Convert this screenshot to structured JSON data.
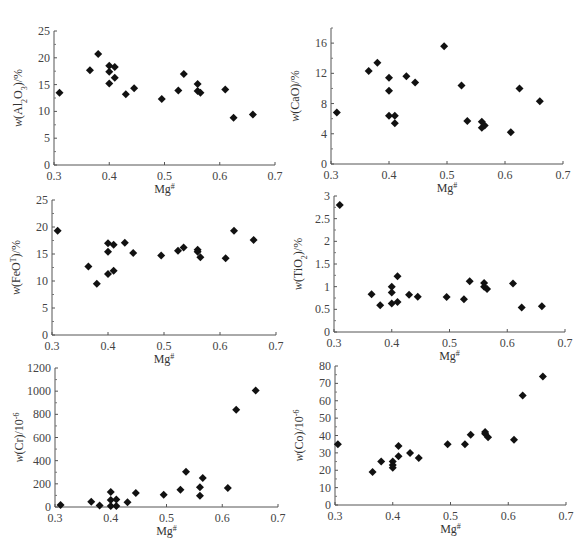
{
  "figure": {
    "caption": ""
  },
  "chart_data": [
    {
      "type": "scatter",
      "id": "al2o3",
      "title": "",
      "xlabel": "Mg#",
      "ylabel": "w(Al2O3)/%",
      "xlim": [
        0.3,
        0.7
      ],
      "ylim": [
        0,
        25
      ],
      "xticks": [
        0.3,
        0.4,
        0.5,
        0.6,
        0.7
      ],
      "yticks": [
        0,
        5,
        10,
        15,
        20,
        25
      ],
      "grid": false,
      "marker": "diamond",
      "x": [
        0.31,
        0.365,
        0.38,
        0.4,
        0.4,
        0.4,
        0.41,
        0.41,
        0.43,
        0.445,
        0.495,
        0.525,
        0.535,
        0.56,
        0.56,
        0.565,
        0.61,
        0.625,
        0.66
      ],
      "y": [
        13.5,
        17.7,
        20.7,
        18.5,
        17.4,
        15.2,
        18.3,
        16.3,
        13.2,
        14.3,
        12.3,
        13.9,
        17.0,
        15.1,
        13.8,
        13.5,
        14.1,
        8.8,
        9.4
      ]
    },
    {
      "type": "scatter",
      "id": "cao",
      "title": "",
      "xlabel": "Mg#",
      "ylabel": "w(CaO)/%",
      "xlim": [
        0.3,
        0.7
      ],
      "ylim": [
        0,
        18
      ],
      "xticks": [
        0.3,
        0.4,
        0.5,
        0.6,
        0.7
      ],
      "yticks": [
        0,
        4,
        8,
        12,
        16
      ],
      "grid": false,
      "marker": "diamond",
      "x": [
        0.31,
        0.365,
        0.38,
        0.4,
        0.4,
        0.4,
        0.41,
        0.41,
        0.43,
        0.445,
        0.495,
        0.525,
        0.535,
        0.56,
        0.56,
        0.565,
        0.61,
        0.625,
        0.66
      ],
      "y": [
        6.8,
        12.3,
        13.4,
        11.4,
        9.7,
        6.4,
        6.4,
        5.4,
        11.6,
        10.8,
        15.6,
        10.4,
        5.7,
        5.6,
        4.8,
        5.1,
        4.2,
        10.0,
        8.3
      ]
    },
    {
      "type": "scatter",
      "id": "feot",
      "title": "",
      "xlabel": "Mg#",
      "ylabel": "w(FeOT)/%",
      "xlim": [
        0.3,
        0.7
      ],
      "ylim": [
        0,
        25
      ],
      "xticks": [
        0.3,
        0.4,
        0.5,
        0.6,
        0.7
      ],
      "yticks": [
        0,
        5,
        10,
        15,
        20,
        25
      ],
      "grid": false,
      "marker": "diamond",
      "x": [
        0.31,
        0.365,
        0.38,
        0.4,
        0.4,
        0.4,
        0.41,
        0.41,
        0.43,
        0.445,
        0.495,
        0.525,
        0.535,
        0.56,
        0.56,
        0.565,
        0.61,
        0.625,
        0.66
      ],
      "y": [
        19.3,
        12.7,
        9.5,
        17.0,
        15.4,
        11.3,
        16.7,
        11.9,
        17.1,
        15.2,
        14.7,
        15.6,
        16.2,
        15.8,
        15.4,
        14.4,
        14.2,
        19.3,
        17.6
      ]
    },
    {
      "type": "scatter",
      "id": "tio2",
      "title": "",
      "xlabel": "Mg#",
      "ylabel": "w(TiO2)/%",
      "xlim": [
        0.3,
        0.7
      ],
      "ylim": [
        0,
        3
      ],
      "xticks": [
        0.3,
        0.4,
        0.5,
        0.6,
        0.7
      ],
      "yticks": [
        0,
        0.5,
        1,
        1.5,
        2,
        2.5,
        3
      ],
      "grid": false,
      "marker": "diamond",
      "x": [
        0.31,
        0.365,
        0.38,
        0.4,
        0.4,
        0.4,
        0.41,
        0.41,
        0.43,
        0.445,
        0.495,
        0.525,
        0.535,
        0.56,
        0.56,
        0.565,
        0.61,
        0.625,
        0.66
      ],
      "y": [
        2.8,
        0.83,
        0.59,
        1.0,
        0.87,
        0.63,
        1.23,
        0.66,
        0.82,
        0.78,
        0.77,
        0.72,
        1.12,
        1.08,
        1.0,
        0.95,
        1.07,
        0.54,
        0.57
      ]
    },
    {
      "type": "scatter",
      "id": "cr",
      "title": "",
      "xlabel": "Mg#",
      "ylabel": "w(Cr)/10^-6",
      "xlim": [
        0.3,
        0.7
      ],
      "ylim": [
        0,
        1200
      ],
      "xticks": [
        0.3,
        0.4,
        0.5,
        0.6,
        0.7
      ],
      "yticks": [
        0,
        200,
        400,
        600,
        800,
        1000,
        1200
      ],
      "grid": false,
      "marker": "diamond",
      "x": [
        0.31,
        0.365,
        0.38,
        0.4,
        0.4,
        0.4,
        0.41,
        0.41,
        0.43,
        0.445,
        0.495,
        0.525,
        0.535,
        0.56,
        0.56,
        0.565,
        0.61,
        0.625,
        0.66
      ],
      "y": [
        18,
        45,
        12,
        130,
        60,
        8,
        65,
        8,
        42,
        120,
        105,
        150,
        305,
        170,
        98,
        250,
        165,
        840,
        1005
      ]
    },
    {
      "type": "scatter",
      "id": "co",
      "title": "",
      "xlabel": "Mg#",
      "ylabel": "w(Co)/10^-6",
      "xlim": [
        0.3,
        0.7
      ],
      "ylim": [
        0,
        80
      ],
      "xticks": [
        0.3,
        0.4,
        0.5,
        0.6,
        0.7
      ],
      "yticks": [
        0,
        10,
        20,
        30,
        40,
        50,
        60,
        70,
        80
      ],
      "grid": false,
      "marker": "diamond",
      "x": [
        0.305,
        0.365,
        0.38,
        0.4,
        0.4,
        0.4,
        0.41,
        0.41,
        0.43,
        0.445,
        0.495,
        0.525,
        0.535,
        0.56,
        0.56,
        0.565,
        0.61,
        0.625,
        0.66
      ],
      "y": [
        35,
        19,
        25,
        25,
        23,
        21.5,
        34,
        28,
        30,
        27,
        35,
        35,
        40.5,
        42,
        41,
        39,
        37.5,
        63,
        74
      ]
    }
  ],
  "panels": [
    {
      "ylabel_main": "w(Al",
      "ylabel_sub": "2",
      "ylabel_rest": "O",
      "ylabel_sub2": "3",
      "ylabel_tail": ")/%",
      "xlabel": "Mg",
      "xlabel_sup": "#"
    },
    {
      "ylabel_main": "w(CaO)/%",
      "xlabel": "Mg",
      "xlabel_sup": "#"
    },
    {
      "ylabel_main": "w(FeO",
      "ylabel_sup": "T",
      "ylabel_tail": ")/%",
      "xlabel": "Mg",
      "xlabel_sup": "#"
    },
    {
      "ylabel_main": "w(TiO",
      "ylabel_sub": "2",
      "ylabel_tail": ")/%",
      "xlabel": "Mg",
      "xlabel_sup": "#"
    },
    {
      "ylabel_main": "w(Cr)/10",
      "ylabel_sup": "-6",
      "xlabel": "Mg",
      "xlabel_sup": "#"
    },
    {
      "ylabel_main": "w(Co)/10",
      "ylabel_sup": "-6",
      "xlabel": "Mg",
      "xlabel_sup": "#"
    }
  ]
}
